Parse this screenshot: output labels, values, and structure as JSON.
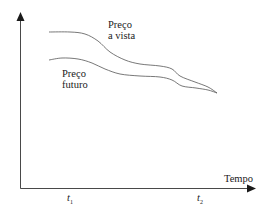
{
  "chart_data": {
    "type": "line",
    "title": "",
    "xlabel": "Tempo",
    "ylabel": "",
    "x_ticks": [
      {
        "label": "t",
        "sub": "1",
        "x": 70
      },
      {
        "label": "t",
        "sub": "2",
        "x": 200
      }
    ],
    "series": [
      {
        "name": "Preço a vista",
        "label_lines": [
          "Preço",
          "a vista"
        ],
        "points": [
          [
            49,
            32
          ],
          [
            70,
            32
          ],
          [
            85,
            34
          ],
          [
            98,
            41
          ],
          [
            110,
            52
          ],
          [
            125,
            60
          ],
          [
            140,
            64
          ],
          [
            160,
            66
          ],
          [
            172,
            69
          ],
          [
            180,
            76
          ],
          [
            195,
            82
          ],
          [
            208,
            87
          ],
          [
            217,
            93
          ]
        ]
      },
      {
        "name": "Preço futuro",
        "label_lines": [
          "Preço",
          "futuro"
        ],
        "points": [
          [
            49,
            60
          ],
          [
            62,
            58
          ],
          [
            78,
            59
          ],
          [
            92,
            63
          ],
          [
            105,
            69
          ],
          [
            120,
            74
          ],
          [
            140,
            76
          ],
          [
            160,
            77
          ],
          [
            172,
            80
          ],
          [
            182,
            86
          ],
          [
            196,
            88
          ],
          [
            208,
            90
          ],
          [
            217,
            93
          ]
        ]
      }
    ],
    "grid": false,
    "legend": "inline labels"
  },
  "colors": {
    "axis": "#1a1a1a",
    "curve": "#555555"
  }
}
